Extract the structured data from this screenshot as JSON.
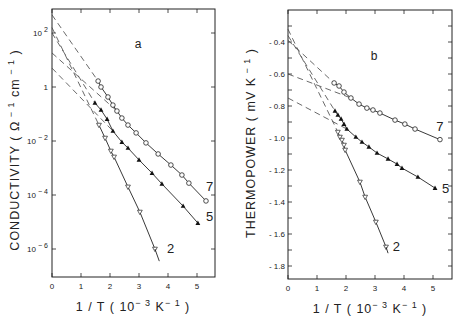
{
  "figure": {
    "panels": [
      "a",
      "b"
    ]
  },
  "chart_data": [
    {
      "type": "scatter",
      "panel": "a",
      "title": "a",
      "xlabel": "1 / T ( 10^-3 K^-1 )",
      "ylabel": "CONDUCTIVITY ( Ω^-1 cm^-1 )",
      "yscale": "log",
      "xlim": [
        0,
        5.6
      ],
      "ylim_log10": [
        -7,
        2.67
      ],
      "xticks": [
        0,
        1,
        2,
        3,
        4,
        5
      ],
      "yticks_log10": [
        2,
        0,
        -2,
        -4,
        -6
      ],
      "ytick_labels": [
        "10^2",
        "1",
        "10^-2",
        "10^-4",
        "10^-6"
      ],
      "grid": false,
      "series": [
        {
          "name": "7",
          "marker": "open-circle",
          "x": [
            1.59,
            1.69,
            1.93,
            2.1,
            2.24,
            2.41,
            2.62,
            2.9,
            3.24,
            3.66,
            4.1,
            4.48,
            4.72,
            5.31
          ],
          "log10_y": [
            0.22,
            0.0,
            -0.37,
            -0.67,
            -0.89,
            -1.15,
            -1.41,
            -1.7,
            -2.07,
            -2.48,
            -2.89,
            -3.26,
            -3.56,
            -4.22
          ]
        },
        {
          "name": "5",
          "marker": "filled-triangle-up",
          "x": [
            1.48,
            1.69,
            1.9,
            2.1,
            2.41,
            2.62,
            3.0,
            3.45,
            3.79,
            4.52,
            5.03
          ],
          "log10_y": [
            -0.59,
            -0.85,
            -1.19,
            -1.63,
            -2.04,
            -2.26,
            -2.7,
            -3.19,
            -3.59,
            -4.41,
            -5.04
          ]
        },
        {
          "name": "2",
          "marker": "open-triangle-down",
          "x": [
            1.62,
            1.83,
            2.03,
            2.14,
            2.62,
            3.03,
            3.55
          ],
          "log10_y": [
            -1.41,
            -1.89,
            -2.37,
            -2.59,
            -3.7,
            -4.63,
            -6.0
          ]
        }
      ],
      "extrapolations": [
        {
          "from": [
            0,
            2.67
          ],
          "to": [
            1.59,
            0.22
          ]
        },
        {
          "from": [
            0,
            2.2
          ],
          "to": [
            1.62,
            -1.41
          ]
        },
        {
          "from": [
            0,
            2.0
          ],
          "to": [
            1.48,
            -0.59
          ]
        },
        {
          "from": [
            0,
            1.26
          ],
          "to": [
            2.24,
            -0.89
          ]
        },
        {
          "from": [
            0,
            0.7
          ],
          "to": [
            2.1,
            -1.63
          ]
        }
      ],
      "labels": [
        {
          "text": "7",
          "x": 5.3,
          "log10_y": -3.7
        },
        {
          "text": "5",
          "x": 5.3,
          "log10_y": -4.8
        },
        {
          "text": "2",
          "x": 3.95,
          "log10_y": -6.0
        }
      ]
    },
    {
      "type": "scatter",
      "panel": "b",
      "title": "b",
      "xlabel": "1 / T ( 10^-3 K^-1 )",
      "ylabel": "THERMOPOWER ( mV K^-1 )",
      "xlim": [
        0,
        5.6
      ],
      "ylim": [
        -1.86,
        -0.2
      ],
      "xticks": [
        0,
        1,
        2,
        3,
        4,
        5
      ],
      "yticks": [
        -0.4,
        -0.6,
        -0.8,
        -1.0,
        -1.2,
        -1.4,
        -1.6,
        -1.8
      ],
      "ytick_labels": [
        "- 0.4",
        "- 0.6",
        "- 0.8",
        "- 1.0",
        "- 1.2",
        "- 1.4",
        "- 1.6",
        "- 1.8"
      ],
      "grid": false,
      "series": [
        {
          "name": "7",
          "marker": "open-circle",
          "x": [
            1.59,
            1.76,
            1.93,
            2.17,
            2.45,
            2.72,
            2.93,
            3.17,
            3.69,
            4.03,
            4.38,
            5.24
          ],
          "y": [
            -0.656,
            -0.675,
            -0.713,
            -0.75,
            -0.788,
            -0.813,
            -0.825,
            -0.844,
            -0.888,
            -0.913,
            -0.944,
            -1.01
          ]
        },
        {
          "name": "5",
          "marker": "filled-triangle-up",
          "x": [
            1.62,
            1.72,
            1.83,
            1.93,
            2.03,
            2.34,
            2.55,
            2.79,
            3.07,
            3.45,
            3.76,
            3.93,
            4.48,
            5.07
          ],
          "y": [
            -0.831,
            -0.856,
            -0.881,
            -0.913,
            -0.944,
            -0.994,
            -1.025,
            -1.056,
            -1.094,
            -1.131,
            -1.163,
            -1.188,
            -1.244,
            -1.313
          ]
        },
        {
          "name": "2",
          "marker": "open-triangle-down",
          "x": [
            1.72,
            1.79,
            1.86,
            1.93,
            1.97,
            2.48,
            2.66,
            3.03,
            3.38
          ],
          "y": [
            -0.963,
            -0.994,
            -1.013,
            -1.044,
            -1.075,
            -1.275,
            -1.369,
            -1.525,
            -1.681
          ]
        }
      ],
      "extrapolations": [
        {
          "from": [
            0,
            -0.32
          ],
          "to": [
            1.72,
            -0.963
          ]
        },
        {
          "from": [
            0,
            -0.36
          ],
          "to": [
            1.62,
            -0.831
          ]
        },
        {
          "from": [
            0,
            -0.39
          ],
          "to": [
            1.59,
            -0.656
          ]
        },
        {
          "from": [
            0,
            -0.6
          ],
          "to": [
            2.17,
            -0.75
          ]
        },
        {
          "from": [
            0,
            -0.75
          ],
          "to": [
            2.03,
            -0.944
          ]
        }
      ],
      "labels": [
        {
          "text": "7",
          "x": 5.1,
          "y": -0.93
        },
        {
          "text": "5",
          "x": 5.3,
          "y": -1.32
        },
        {
          "text": "2",
          "x": 3.6,
          "y": -1.68
        }
      ]
    }
  ],
  "text": {
    "panel_a_letter": "a",
    "panel_b_letter": "b",
    "panel_a_ylabel": "CONDUCTIVITY  ( Ω",
    "panel_b_ylabel": "THERMOPOWER  ( mV K",
    "xlabel": "1 / T  ( 10",
    "xlabel_exp": "− 3",
    "xlabel_unit": "K",
    "xlabel_unit_exp": "− 1",
    "xlabel_close": ")"
  }
}
